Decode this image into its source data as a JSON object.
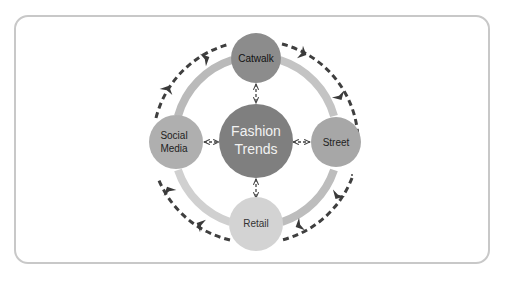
{
  "diagram": {
    "title": "Fashion Trends",
    "center": {
      "label_line1": "Fashion",
      "label_line2": "Trends",
      "color": "#7f7f7f",
      "text_color": "#f2f2f2"
    },
    "nodes": [
      {
        "id": "catwalk",
        "label_line1": "Catwalk",
        "label_line2": "",
        "position": "top",
        "color": "#8c8c8c",
        "text_color": "#111111"
      },
      {
        "id": "social-media",
        "label_line1": "Social",
        "label_line2": "Media",
        "position": "left",
        "color": "#afafaf",
        "text_color": "#222222"
      },
      {
        "id": "street",
        "label_line1": "Street",
        "label_line2": "",
        "position": "right",
        "color": "#a7a7a7",
        "text_color": "#222222"
      },
      {
        "id": "retail",
        "label_line1": "Retail",
        "label_line2": "",
        "position": "bottom",
        "color": "#d3d3d3",
        "text_color": "#333333"
      }
    ],
    "connections": [
      {
        "from": "fashion-trends",
        "to": "catwalk",
        "style": "dashed",
        "arrows": "both"
      },
      {
        "from": "fashion-trends",
        "to": "social-media",
        "style": "dashed",
        "arrows": "both"
      },
      {
        "from": "fashion-trends",
        "to": "street",
        "style": "dashed",
        "arrows": "both"
      },
      {
        "from": "fashion-trends",
        "to": "retail",
        "style": "dashed",
        "arrows": "both"
      }
    ],
    "inner_ring": {
      "color": "#c4c4c4",
      "style": "solid"
    },
    "outer_ring": {
      "color": "#3f3f3f",
      "style": "dashed",
      "direction": "clockwise"
    },
    "frame": {
      "border_color": "#c8c8c8"
    }
  }
}
